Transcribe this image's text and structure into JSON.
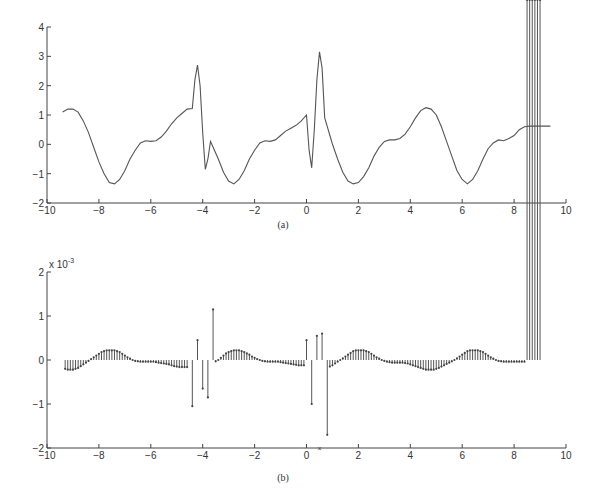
{
  "chart_data": [
    {
      "id": "a",
      "type": "line",
      "caption": "(a)",
      "title": "",
      "xlabel": "",
      "ylabel": "",
      "xlim": [
        -10,
        10
      ],
      "ylim": [
        -2,
        4
      ],
      "xticks": [
        -10,
        -8,
        -6,
        -4,
        -2,
        0,
        2,
        4,
        6,
        8,
        10
      ],
      "yticks": [
        -2,
        -1,
        0,
        1,
        2,
        3,
        4
      ],
      "grid": false,
      "legend": null,
      "series": [
        {
          "name": "signal",
          "x": [
            -9.4,
            -9.2,
            -9.0,
            -8.8,
            -8.6,
            -8.4,
            -8.2,
            -8.0,
            -7.8,
            -7.6,
            -7.4,
            -7.2,
            -7.0,
            -6.8,
            -6.6,
            -6.4,
            -6.2,
            -6.0,
            -5.8,
            -5.6,
            -5.4,
            -5.2,
            -5.0,
            -4.8,
            -4.6,
            -4.4,
            -4.3,
            -4.2,
            -4.1,
            -4.0,
            -3.9,
            -3.8,
            -3.7,
            -3.6,
            -3.4,
            -3.2,
            -3.0,
            -2.8,
            -2.6,
            -2.4,
            -2.2,
            -2.0,
            -1.8,
            -1.6,
            -1.4,
            -1.2,
            -1.0,
            -0.8,
            -0.6,
            -0.4,
            -0.2,
            0.0,
            0.1,
            0.2,
            0.3,
            0.4,
            0.5,
            0.6,
            0.7,
            0.8,
            0.9,
            1.0,
            1.2,
            1.4,
            1.6,
            1.8,
            2.0,
            2.2,
            2.4,
            2.6,
            2.8,
            3.0,
            3.2,
            3.4,
            3.6,
            3.8,
            4.0,
            4.2,
            4.4,
            4.6,
            4.8,
            5.0,
            5.2,
            5.4,
            5.6,
            5.8,
            6.0,
            6.2,
            6.4,
            6.6,
            6.8,
            7.0,
            7.2,
            7.4,
            7.6,
            7.8,
            8.0,
            8.2,
            8.4,
            8.6,
            8.8,
            9.0,
            9.2,
            9.4
          ],
          "y": [
            1.1,
            1.2,
            1.2,
            1.1,
            0.8,
            0.4,
            -0.1,
            -0.6,
            -1.0,
            -1.3,
            -1.35,
            -1.2,
            -0.9,
            -0.5,
            -0.2,
            0.05,
            0.12,
            0.1,
            0.12,
            0.25,
            0.45,
            0.7,
            0.9,
            1.05,
            1.2,
            1.22,
            2.2,
            2.7,
            2.0,
            0.4,
            -0.85,
            -0.5,
            0.1,
            -0.1,
            -0.5,
            -0.95,
            -1.25,
            -1.35,
            -1.2,
            -0.9,
            -0.5,
            -0.2,
            0.05,
            0.12,
            0.1,
            0.15,
            0.3,
            0.45,
            0.55,
            0.65,
            0.8,
            1.0,
            -0.2,
            -0.8,
            0.5,
            2.2,
            3.15,
            2.6,
            0.9,
            0.6,
            0.3,
            0.0,
            -0.5,
            -0.95,
            -1.25,
            -1.35,
            -1.3,
            -1.1,
            -0.8,
            -0.4,
            -0.1,
            0.1,
            0.15,
            0.15,
            0.2,
            0.35,
            0.6,
            0.9,
            1.15,
            1.25,
            1.2,
            1.0,
            0.6,
            0.1,
            -0.4,
            -0.9,
            -1.2,
            -1.35,
            -1.2,
            -0.9,
            -0.5,
            -0.15,
            0.05,
            0.15,
            0.12,
            0.2,
            0.3,
            0.5,
            0.6,
            0.62,
            0.62,
            0.62,
            0.62,
            0.62
          ]
        }
      ]
    },
    {
      "id": "b",
      "type": "stem",
      "caption": "(b)",
      "title": "",
      "xlabel": "",
      "ylabel": "",
      "y_multiplier": "x 10^-3",
      "y_multiplier_base": "x 10",
      "y_multiplier_exp": "-3",
      "xlim": [
        -10,
        10
      ],
      "ylim": [
        -2,
        2
      ],
      "xticks": [
        -10,
        -8,
        -6,
        -4,
        -2,
        0,
        2,
        4,
        6,
        8,
        10
      ],
      "yticks": [
        -2,
        -1,
        0,
        1,
        2
      ],
      "grid": false,
      "legend": null,
      "series": [
        {
          "name": "error (x1e-3)",
          "x": [
            -9.3,
            -9.2,
            -9.1,
            -9.0,
            -8.9,
            -8.8,
            -8.7,
            -8.6,
            -8.5,
            -8.4,
            -8.3,
            -8.2,
            -8.1,
            -8.0,
            -7.9,
            -7.8,
            -7.7,
            -7.6,
            -7.5,
            -7.4,
            -7.3,
            -7.2,
            -7.1,
            -7.0,
            -6.9,
            -6.8,
            -6.7,
            -6.6,
            -6.5,
            -6.4,
            -6.3,
            -6.2,
            -6.1,
            -6.0,
            -5.9,
            -5.8,
            -5.7,
            -5.6,
            -5.5,
            -5.4,
            -5.3,
            -5.2,
            -5.1,
            -5.0,
            -4.9,
            -4.8,
            -4.7,
            -4.6,
            -4.4,
            -4.2,
            -4.0,
            -3.8,
            -3.6,
            -3.5,
            -3.4,
            -3.3,
            -3.2,
            -3.1,
            -3.0,
            -2.9,
            -2.8,
            -2.7,
            -2.6,
            -2.5,
            -2.4,
            -2.3,
            -2.2,
            -2.1,
            -2.0,
            -1.9,
            -1.8,
            -1.7,
            -1.6,
            -1.5,
            -1.4,
            -1.3,
            -1.2,
            -1.1,
            -1.0,
            -0.9,
            -0.8,
            -0.7,
            -0.6,
            -0.5,
            -0.4,
            -0.3,
            -0.2,
            -0.1,
            0.0,
            0.2,
            0.4,
            0.6,
            0.8,
            0.9,
            1.0,
            1.1,
            1.2,
            1.3,
            1.4,
            1.5,
            1.6,
            1.7,
            1.8,
            1.9,
            2.0,
            2.1,
            2.2,
            2.3,
            2.4,
            2.5,
            2.6,
            2.7,
            2.8,
            2.9,
            3.0,
            3.1,
            3.2,
            3.3,
            3.4,
            3.5,
            3.6,
            3.7,
            3.8,
            3.9,
            4.0,
            4.1,
            4.2,
            4.3,
            4.4,
            4.5,
            4.6,
            4.7,
            4.8,
            4.9,
            5.0,
            5.1,
            5.2,
            5.3,
            5.4,
            5.5,
            5.6,
            5.7,
            5.8,
            5.9,
            6.0,
            6.1,
            6.2,
            6.3,
            6.4,
            6.5,
            6.6,
            6.7,
            6.8,
            6.9,
            7.0,
            7.1,
            7.2,
            7.3,
            7.4,
            7.5,
            7.6,
            7.7,
            7.8,
            7.9,
            8.0,
            8.1,
            8.2,
            8.3,
            8.4,
            8.5,
            8.6,
            8.7,
            8.8,
            8.9,
            9.0
          ],
          "y": [
            -0.2,
            -0.22,
            -0.22,
            -0.22,
            -0.2,
            -0.18,
            -0.14,
            -0.1,
            -0.06,
            -0.02,
            0.02,
            0.06,
            0.1,
            0.14,
            0.18,
            0.2,
            0.22,
            0.22,
            0.22,
            0.22,
            0.2,
            0.18,
            0.14,
            0.1,
            0.06,
            0.03,
            0.0,
            -0.02,
            -0.03,
            -0.04,
            -0.04,
            -0.04,
            -0.04,
            -0.04,
            -0.04,
            -0.05,
            -0.06,
            -0.07,
            -0.08,
            -0.09,
            -0.1,
            -0.12,
            -0.14,
            -0.15,
            -0.16,
            -0.16,
            -0.16,
            -0.16,
            -1.05,
            0.45,
            -0.65,
            -0.85,
            1.15,
            -0.03,
            0.0,
            0.05,
            0.1,
            0.15,
            0.18,
            0.2,
            0.22,
            0.22,
            0.22,
            0.2,
            0.18,
            0.15,
            0.12,
            0.08,
            0.05,
            0.02,
            0.0,
            -0.02,
            -0.03,
            -0.04,
            -0.04,
            -0.04,
            -0.04,
            -0.04,
            -0.05,
            -0.06,
            -0.07,
            -0.08,
            -0.09,
            -0.1,
            -0.11,
            -0.12,
            -0.12,
            -0.12,
            0.45,
            -1.0,
            0.55,
            0.6,
            -1.7,
            -0.15,
            -0.12,
            -0.08,
            -0.04,
            0.0,
            0.04,
            0.08,
            0.12,
            0.16,
            0.2,
            0.22,
            0.22,
            0.22,
            0.22,
            0.2,
            0.18,
            0.14,
            0.1,
            0.06,
            0.03,
            0.0,
            -0.02,
            -0.04,
            -0.05,
            -0.06,
            -0.06,
            -0.06,
            -0.06,
            -0.06,
            -0.07,
            -0.08,
            -0.1,
            -0.12,
            -0.14,
            -0.16,
            -0.18,
            -0.2,
            -0.22,
            -0.22,
            -0.22,
            -0.22,
            -0.2,
            -0.18,
            -0.15,
            -0.12,
            -0.09,
            -0.06,
            -0.03,
            0.0,
            0.04,
            0.08,
            0.12,
            0.16,
            0.2,
            0.22,
            0.22,
            0.22,
            0.22,
            0.2,
            0.18,
            0.14,
            0.1,
            0.06,
            0.03,
            0.0,
            -0.02,
            -0.03,
            -0.04,
            -0.04,
            -0.04,
            -0.04,
            -0.04,
            -0.04,
            -0.04,
            -0.04,
            -0.04
          ]
        }
      ]
    }
  ]
}
